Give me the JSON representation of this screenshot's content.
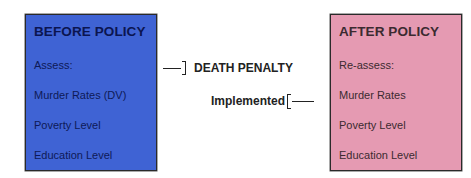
{
  "before": {
    "title": "BEFORE POLICY",
    "items": [
      "Assess:",
      "Murder Rates (DV)",
      "Poverty Level",
      "Education Level"
    ],
    "fill_color": "#3f63d4"
  },
  "intervention": {
    "line1": "DEATH PENALTY",
    "line2": "Implemented"
  },
  "after": {
    "title": "AFTER POLICY",
    "items": [
      "Re-assess:",
      "Murder Rates",
      "Poverty Level",
      "Education Level"
    ],
    "fill_color": "#e59ab2"
  }
}
